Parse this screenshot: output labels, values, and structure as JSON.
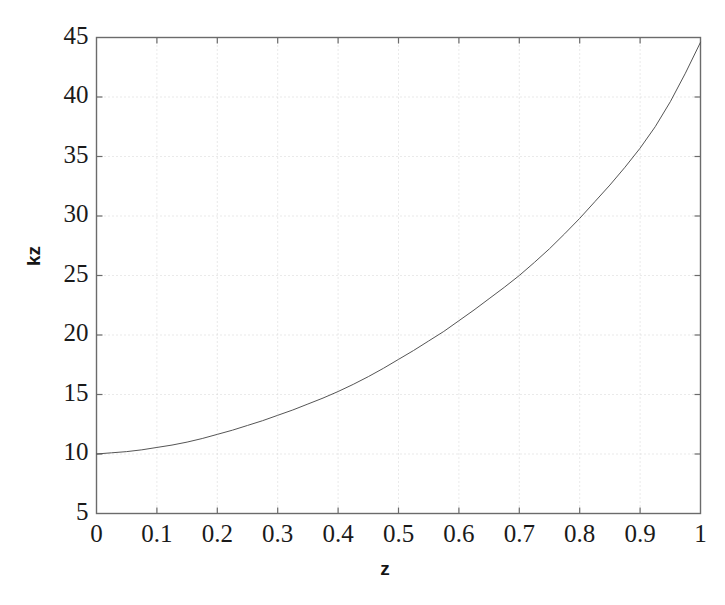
{
  "chart_data": {
    "type": "line",
    "title": "",
    "xlabel": "z",
    "ylabel": "kz",
    "xlim": [
      0,
      1
    ],
    "ylim": [
      5,
      45
    ],
    "grid": true,
    "grid_style": "dotted",
    "legend": null,
    "xticks": [
      "0",
      "0.1",
      "0.2",
      "0.3",
      "0.4",
      "0.5",
      "0.6",
      "0.7",
      "0.8",
      "0.9",
      "1"
    ],
    "xtick_values": [
      0,
      0.1,
      0.2,
      0.3,
      0.4,
      0.5,
      0.6,
      0.7,
      0.8,
      0.9,
      1
    ],
    "yticks": [
      "5",
      "10",
      "15",
      "20",
      "25",
      "30",
      "35",
      "40",
      "45"
    ],
    "ytick_values": [
      5,
      10,
      15,
      20,
      25,
      30,
      35,
      40,
      45
    ],
    "series": [
      {
        "name": "kz",
        "color": "#555555",
        "linewidth": 1,
        "x": [
          0,
          0.025,
          0.05,
          0.075,
          0.1,
          0.125,
          0.15,
          0.175,
          0.2,
          0.225,
          0.25,
          0.275,
          0.3,
          0.325,
          0.35,
          0.375,
          0.4,
          0.425,
          0.45,
          0.475,
          0.5,
          0.525,
          0.55,
          0.575,
          0.6,
          0.625,
          0.65,
          0.675,
          0.7,
          0.725,
          0.75,
          0.775,
          0.8,
          0.825,
          0.85,
          0.875,
          0.9,
          0.925,
          0.95,
          0.975,
          1
        ],
        "y": [
          10.0,
          10.1,
          10.2,
          10.35,
          10.55,
          10.75,
          11.0,
          11.3,
          11.65,
          12.0,
          12.4,
          12.8,
          13.25,
          13.7,
          14.2,
          14.7,
          15.25,
          15.85,
          16.5,
          17.2,
          17.95,
          18.7,
          19.5,
          20.3,
          21.2,
          22.1,
          23.05,
          24.0,
          25.0,
          26.1,
          27.25,
          28.5,
          29.8,
          31.2,
          32.6,
          34.1,
          35.7,
          37.5,
          39.6,
          42.0,
          44.6
        ]
      }
    ],
    "key_points": [
      {
        "z": 0.0,
        "kz": 10.0
      },
      {
        "z": 0.1,
        "kz": 10.55
      },
      {
        "z": 0.2,
        "kz": 11.65
      },
      {
        "z": 0.3,
        "kz": 13.25
      },
      {
        "z": 0.4,
        "kz": 15.25
      },
      {
        "z": 0.5,
        "kz": 17.95
      },
      {
        "z": 0.6,
        "kz": 21.2
      },
      {
        "z": 0.7,
        "kz": 25.0
      },
      {
        "z": 0.8,
        "kz": 29.8
      },
      {
        "z": 0.9,
        "kz": 35.7
      },
      {
        "z": 1.0,
        "kz": 44.6
      }
    ]
  },
  "style": {
    "background": "#ffffff",
    "axis_color": "#6b6b6b",
    "grid_color": "#cfcfcf",
    "text_color": "#1a1a1a",
    "line_color": "#555555"
  }
}
